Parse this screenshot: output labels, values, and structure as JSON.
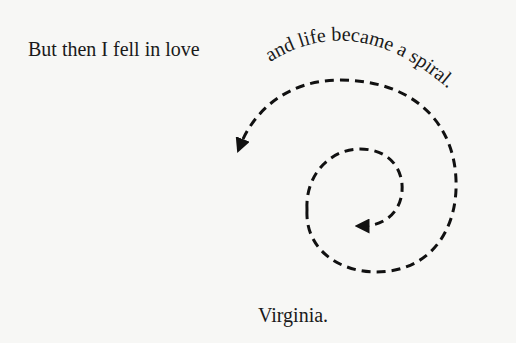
{
  "text": {
    "line1": "But then I fell in love",
    "curved": "and life became a spiral.",
    "signature": "Virginia."
  },
  "graphic": {
    "type": "dashed-spiral-with-arrows",
    "stroke_color": "#111111",
    "arrows": 2
  }
}
